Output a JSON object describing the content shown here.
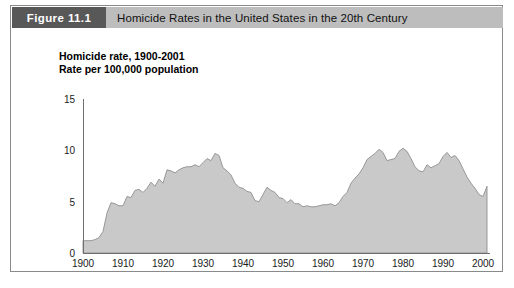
{
  "figure": {
    "number_label": "Figure 11.1",
    "title": "Homicide Rates in the United States in the 20th Century"
  },
  "chart_caption": {
    "line1": "Homicide rate, 1900-2001",
    "line2": "Rate per 100,000 population"
  },
  "colors": {
    "figure_tab_background": "#585858",
    "figure_title_background": "#bdbdbd",
    "frame_border": "#8a8a8a",
    "area_fill": "#c9c9c9",
    "area_stroke": "#8f8f8f",
    "axis": "#6f6f6f",
    "text": "#111111"
  },
  "chart_data": {
    "type": "area",
    "title": "Homicide rate, 1900-2001",
    "subtitle": "Rate per 100,000 population",
    "xlabel": "",
    "ylabel": "",
    "xlim": [
      1900,
      2001
    ],
    "ylim": [
      0,
      15
    ],
    "grid": false,
    "legend": "none",
    "x_tick_labels": [
      "1900",
      "1910",
      "1920",
      "1930",
      "1940",
      "1950",
      "1960",
      "1970",
      "1980",
      "1990",
      "2000"
    ],
    "x_ticks": [
      1900,
      1910,
      1920,
      1930,
      1940,
      1950,
      1960,
      1970,
      1980,
      1990,
      2000
    ],
    "y_tick_labels": [
      "0",
      "5",
      "10",
      "15"
    ],
    "y_ticks": [
      0,
      5,
      10,
      15
    ],
    "series": [
      {
        "name": "Homicide rate per 100,000 population",
        "x": [
          1900,
          1901,
          1902,
          1903,
          1904,
          1905,
          1906,
          1907,
          1908,
          1909,
          1910,
          1911,
          1912,
          1913,
          1914,
          1915,
          1916,
          1917,
          1918,
          1919,
          1920,
          1921,
          1922,
          1923,
          1924,
          1925,
          1926,
          1927,
          1928,
          1929,
          1930,
          1931,
          1932,
          1933,
          1934,
          1935,
          1936,
          1937,
          1938,
          1939,
          1940,
          1941,
          1942,
          1943,
          1944,
          1945,
          1946,
          1947,
          1948,
          1949,
          1950,
          1951,
          1952,
          1953,
          1954,
          1955,
          1956,
          1957,
          1958,
          1959,
          1960,
          1961,
          1962,
          1963,
          1964,
          1965,
          1966,
          1967,
          1968,
          1969,
          1970,
          1971,
          1972,
          1973,
          1974,
          1975,
          1976,
          1977,
          1978,
          1979,
          1980,
          1981,
          1982,
          1983,
          1984,
          1985,
          1986,
          1987,
          1988,
          1989,
          1990,
          1991,
          1992,
          1993,
          1994,
          1995,
          1996,
          1997,
          1998,
          1999,
          2000,
          2001
        ],
        "values": [
          1.2,
          1.2,
          1.2,
          1.3,
          1.5,
          2.1,
          3.9,
          4.9,
          4.8,
          4.6,
          4.6,
          5.5,
          5.4,
          6.1,
          6.2,
          5.9,
          6.3,
          6.9,
          6.5,
          7.2,
          6.8,
          8.1,
          8.0,
          7.8,
          8.1,
          8.3,
          8.4,
          8.4,
          8.6,
          8.4,
          8.8,
          9.2,
          9.0,
          9.7,
          9.5,
          8.3,
          8.0,
          7.6,
          6.8,
          6.4,
          6.3,
          6.0,
          5.9,
          5.1,
          5.0,
          5.7,
          6.4,
          6.1,
          5.9,
          5.4,
          5.3,
          4.9,
          5.2,
          4.8,
          4.8,
          4.5,
          4.6,
          4.5,
          4.5,
          4.6,
          4.7,
          4.7,
          4.8,
          4.6,
          4.9,
          5.5,
          5.9,
          6.8,
          7.3,
          7.7,
          8.3,
          9.1,
          9.4,
          9.7,
          10.1,
          9.8,
          9.0,
          9.1,
          9.2,
          9.9,
          10.2,
          9.9,
          9.2,
          8.4,
          8.0,
          7.9,
          8.6,
          8.3,
          8.5,
          8.7,
          9.4,
          9.8,
          9.3,
          9.5,
          9.0,
          8.2,
          7.4,
          6.8,
          6.3,
          5.7,
          5.5,
          6.5
        ]
      }
    ],
    "annotations": []
  }
}
